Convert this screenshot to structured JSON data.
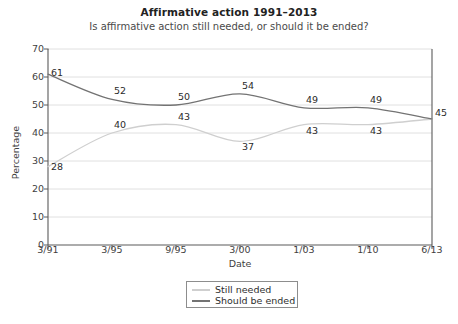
{
  "chart_data": {
    "type": "line",
    "title": "Affirmative action 1991–2013",
    "subtitle": "Is affirmative action still needed, or should it be ended?",
    "xlabel": "Date",
    "ylabel": "Percentage",
    "categories": [
      "3/91",
      "3/95",
      "9/95",
      "3/00",
      "1/03",
      "1/10",
      "6/13"
    ],
    "ylim": [
      0,
      70
    ],
    "yticks": [
      0,
      10,
      20,
      30,
      40,
      50,
      60,
      70
    ],
    "grid": true,
    "legend_position": "bottom-center",
    "series": [
      {
        "name": "Still needed",
        "color": "#cfcfcf",
        "values": [
          28,
          40,
          43,
          37,
          43,
          43,
          45
        ]
      },
      {
        "name": "Should be ended",
        "color": "#737373",
        "values": [
          61,
          52,
          50,
          54,
          49,
          49,
          45
        ]
      }
    ],
    "point_labels": [
      {
        "series": "Should be ended",
        "category": "3/91",
        "text": "61"
      },
      {
        "series": "Should be ended",
        "category": "3/95",
        "text": "52"
      },
      {
        "series": "Should be ended",
        "category": "9/95",
        "text": "50"
      },
      {
        "series": "Should be ended",
        "category": "3/00",
        "text": "54"
      },
      {
        "series": "Should be ended",
        "category": "1/03",
        "text": "49"
      },
      {
        "series": "Should be ended",
        "category": "1/10",
        "text": "49"
      },
      {
        "series": "Should be ended",
        "category": "6/13",
        "text": "45"
      },
      {
        "series": "Still needed",
        "category": "3/91",
        "text": "28"
      },
      {
        "series": "Still needed",
        "category": "3/95",
        "text": "40"
      },
      {
        "series": "Still needed",
        "category": "9/95",
        "text": "43"
      },
      {
        "series": "Still needed",
        "category": "3/00",
        "text": "37"
      },
      {
        "series": "Still needed",
        "category": "1/03",
        "text": "43"
      },
      {
        "series": "Still needed",
        "category": "1/10",
        "text": "43"
      }
    ]
  },
  "axes": {
    "ytick_labels": [
      "70",
      "60",
      "50",
      "40",
      "30",
      "20",
      "10",
      "0"
    ],
    "xtick_labels": [
      "3/91",
      "3/95",
      "9/95",
      "3/00",
      "1/03",
      "1/10",
      "6/13"
    ]
  },
  "legend": {
    "items": [
      {
        "label": "Still needed",
        "color": "#cfcfcf"
      },
      {
        "label": "Should be ended",
        "color": "#737373"
      }
    ]
  },
  "colors": {
    "axis": "#5a5a5a",
    "grid": "#d8d8d8",
    "background": "#ffffff",
    "still_needed": "#cfcfcf",
    "should_be_ended": "#737373"
  }
}
